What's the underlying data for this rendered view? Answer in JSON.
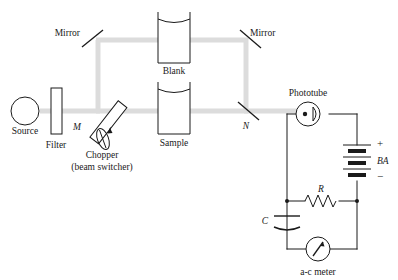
{
  "figure": {
    "type": "instrument-schematic"
  },
  "colors": {
    "beam": "#dcdcdc",
    "wire": "#1a1a1a",
    "outline": "#1a1a1a",
    "background": "#ffffff",
    "battery_fill": "#1a1a1a"
  },
  "optical": {
    "source_label": "Source",
    "filter_label": "Filter",
    "chopper_letter": "M",
    "chopper_label": "Chopper",
    "chopper_sublabel": "(beam switcher)",
    "mirror_left_label": "Mirror",
    "mirror_right_label": "Mirror",
    "blank_label": "Blank",
    "sample_label": "Sample",
    "node_n_label": "N"
  },
  "circuit": {
    "phototube_label": "Phototube",
    "battery_label": "BA",
    "battery_plus": "+",
    "battery_minus": "−",
    "resistor_label": "R",
    "capacitor_label": "C",
    "meter_label": "a-c meter"
  },
  "icons": {
    "source_lamp": "circle-lamp-icon",
    "filter_plate": "rectangle-filter-icon",
    "mirror": "diagonal-mirror-icon",
    "cuvette": "cuvette-icon",
    "phototube": "phototube-icon",
    "battery": "battery-cells-icon",
    "resistor": "zigzag-resistor-icon",
    "capacitor": "curved-plate-capacitor-icon",
    "meter": "needle-gauge-icon",
    "chopper_blade": "rotating-blade-icon"
  }
}
